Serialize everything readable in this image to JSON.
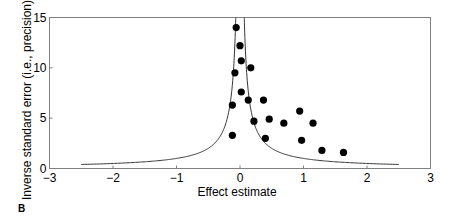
{
  "chart_data": {
    "type": "scatter",
    "title": "",
    "xlabel": "Effect estimate",
    "ylabel": "Inverse standard error (i.e., precision)",
    "xlim": [
      -3,
      3
    ],
    "ylim": [
      0,
      15
    ],
    "xticks": [
      -3,
      -2,
      -1,
      0,
      1,
      2,
      3
    ],
    "yticks": [
      0,
      5,
      10,
      15
    ],
    "grid": false,
    "legend": null,
    "points": [
      {
        "x": -0.06,
        "y": 14.0
      },
      {
        "x": 0.0,
        "y": 12.2
      },
      {
        "x": 0.02,
        "y": 10.7
      },
      {
        "x": -0.08,
        "y": 9.5
      },
      {
        "x": 0.17,
        "y": 10.0
      },
      {
        "x": 0.02,
        "y": 7.6
      },
      {
        "x": 0.13,
        "y": 6.8
      },
      {
        "x": 0.37,
        "y": 6.8
      },
      {
        "x": -0.12,
        "y": 6.3
      },
      {
        "x": 0.22,
        "y": 4.7
      },
      {
        "x": 0.46,
        "y": 4.9
      },
      {
        "x": 0.69,
        "y": 4.5
      },
      {
        "x": -0.12,
        "y": 3.3
      },
      {
        "x": 0.4,
        "y": 3.0
      },
      {
        "x": 0.94,
        "y": 5.7
      },
      {
        "x": 1.15,
        "y": 4.5
      },
      {
        "x": 0.97,
        "y": 2.8
      },
      {
        "x": 1.29,
        "y": 1.8
      },
      {
        "x": 1.63,
        "y": 1.6
      }
    ],
    "funnel": {
      "description": "Pseudo-confidence funnel curve, precision = 1/|effect|",
      "center": 0,
      "x_extent": [
        -2.5,
        2.5
      ]
    },
    "panel_label": "B"
  },
  "colors": {
    "points": "#000000",
    "curve": "#333333",
    "axes": "#808080"
  }
}
